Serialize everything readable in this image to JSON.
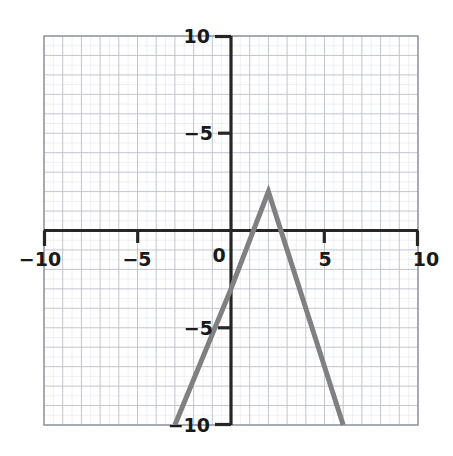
{
  "chart_data": {
    "type": "line",
    "title": "",
    "xlabel": "",
    "ylabel": "",
    "xlim": [
      -10,
      10
    ],
    "ylim": [
      -10,
      10
    ],
    "grid": true,
    "grid_step": 1,
    "legend": "none",
    "xticks": [
      -10,
      -5,
      0,
      5,
      10
    ],
    "yticks": [
      -10,
      -5,
      5,
      10
    ],
    "xtick_labels": [
      "−10",
      "−5",
      "0",
      "5",
      "10"
    ],
    "ytick_labels": [
      "−10",
      "−5",
      "5",
      "10"
    ],
    "series": [
      {
        "name": "piecewise-linear",
        "color": "#808080",
        "linewidth": 5,
        "points": [
          {
            "x": -3.0,
            "y": -10
          },
          {
            "x": 0,
            "y": -3
          },
          {
            "x": 2,
            "y": 2
          },
          {
            "x": 6,
            "y": -10
          }
        ]
      }
    ],
    "annotations": {
      "vertex": {
        "x": 2,
        "y": 2
      },
      "y_intercept": {
        "x": 0,
        "y": -3
      },
      "left_endpoint": {
        "x": -3,
        "y": -10
      },
      "right_endpoint": {
        "x": 6,
        "y": -10
      },
      "left_slope": 2.5,
      "right_slope": -3
    },
    "colors": {
      "curve": "#808080",
      "axis": "#262626",
      "grid_major": "#b9bcc4",
      "grid_minor": "#dfe2e8",
      "frame": "#8d9096",
      "background": "#ffffff",
      "tick_text": "#1a1a1a"
    }
  },
  "origin_label": "0"
}
